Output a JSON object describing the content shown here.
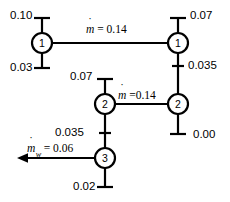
{
  "diagram": {
    "stroke_color": "#000000",
    "background_color": "#ffffff",
    "nodes": [
      {
        "id": "node-top-left",
        "label": "1",
        "cx": 42,
        "cy": 43,
        "r": 10
      },
      {
        "id": "node-top-right",
        "label": "1",
        "cx": 178,
        "cy": 43,
        "r": 10
      },
      {
        "id": "node-mid-left",
        "label": "2",
        "cx": 105,
        "cy": 104,
        "r": 10
      },
      {
        "id": "node-mid-right",
        "label": "2",
        "cx": 178,
        "cy": 104,
        "r": 10
      },
      {
        "id": "node-bottom",
        "label": "3",
        "cx": 105,
        "cy": 158,
        "r": 10
      }
    ],
    "flows": [
      {
        "id": "flow-top",
        "symbol": "m",
        "subscript": "",
        "equals": " = ",
        "value": "0.14"
      },
      {
        "id": "flow-middle",
        "symbol": "m",
        "subscript": "",
        "equals": " =",
        "value": "0.14"
      },
      {
        "id": "flow-waste",
        "symbol": "m",
        "subscript": "w",
        "equals": " = ",
        "value": "0.06"
      }
    ],
    "stub_values": [
      {
        "id": "stub-top-left-in",
        "value": "0.10"
      },
      {
        "id": "stub-top-left-out",
        "value": "0.03"
      },
      {
        "id": "stub-top-right-in",
        "value": "0.07"
      },
      {
        "id": "stub-top-right-down",
        "value": "0.035"
      },
      {
        "id": "stub-mid-left-in",
        "value": "0.07"
      },
      {
        "id": "stub-mid-left-down",
        "value": "0.035"
      },
      {
        "id": "stub-mid-right-out",
        "value": "0.00"
      },
      {
        "id": "stub-bottom-out",
        "value": "0.02"
      }
    ]
  }
}
